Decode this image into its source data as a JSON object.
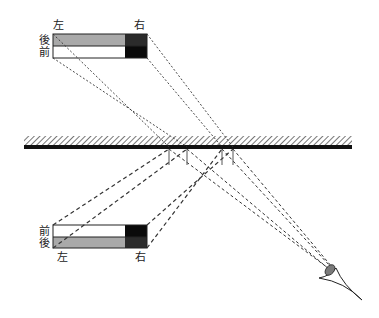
{
  "diagram": {
    "title": "",
    "labels": {
      "top_left": "左",
      "top_right": "右",
      "top_back": "後",
      "top_front": "前",
      "bottom_front": "前",
      "bottom_back": "後",
      "bottom_left": "左",
      "bottom_right": "右"
    },
    "colors": {
      "gray": "#a9a9a9",
      "dark": "#2b2b2b",
      "black": "#0a0a0a",
      "mirror": "#111111",
      "iris": "#7a7a7a"
    },
    "elements": [
      "object-box",
      "mirror",
      "mirror-image-box",
      "eye",
      "light-rays",
      "normals"
    ]
  }
}
